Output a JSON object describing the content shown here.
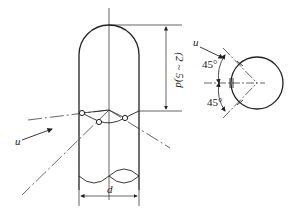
{
  "diagram": {
    "type": "technical-drawing",
    "colors": {
      "stroke": "#222222",
      "background": "#ffffff"
    },
    "labels": {
      "height_dim": "(2 ~ 5)d",
      "width_dim": "d",
      "flow_left": "u",
      "flow_right": "u",
      "angle_top": "45°",
      "angle_bottom": "45°"
    }
  }
}
